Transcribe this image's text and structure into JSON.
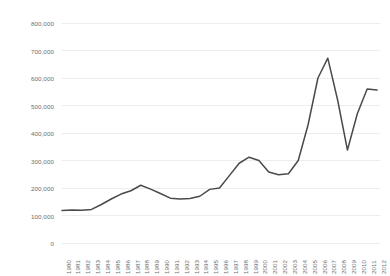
{
  "chart_data": {
    "type": "line",
    "title": "",
    "xlabel": "",
    "ylabel": "",
    "ylim": [
      0,
      800000
    ],
    "ytick_values": [
      0,
      100000,
      200000,
      300000,
      400000,
      500000,
      600000,
      700000,
      800000
    ],
    "ytick_labels": [
      "0",
      "100,000",
      "200,000",
      "300,000",
      "400,000",
      "500,000",
      "600,000",
      "700,000",
      "800,000"
    ],
    "grid": true,
    "legend": false,
    "line_color": "#4a4a4a",
    "grid_color": "#e8e8e8",
    "categories": [
      "1980",
      "1981",
      "1982",
      "1983",
      "1984",
      "1985",
      "1986",
      "1987",
      "1988",
      "1989",
      "1990",
      "1991",
      "1992",
      "1993",
      "1994",
      "1995",
      "1996",
      "1997",
      "1998",
      "1999",
      "2000",
      "2001",
      "2002",
      "2003",
      "2004",
      "2005",
      "2006",
      "2007",
      "2008",
      "2009",
      "2010",
      "2011",
      "2012"
    ],
    "values": [
      118000,
      120000,
      119000,
      122000,
      140000,
      160000,
      178000,
      190000,
      210000,
      196000,
      180000,
      163000,
      160000,
      162000,
      170000,
      195000,
      200000,
      245000,
      290000,
      312000,
      300000,
      258000,
      248000,
      252000,
      300000,
      430000,
      600000,
      672000,
      520000,
      338000,
      470000,
      560000,
      556000
    ]
  }
}
